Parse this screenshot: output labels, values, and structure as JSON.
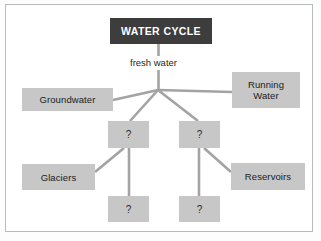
{
  "diagram": {
    "type": "concept-map",
    "title": "WATER CYCLE",
    "frame": {
      "border_color": "#b9bcbd",
      "background": "#ffffff"
    },
    "colors": {
      "title_box_fill": "#3d3d3d",
      "title_box_text": "#ffffff",
      "node_fill": "#c7c7c7",
      "node_text": "#1b1b1b",
      "connector": "#a3a3a3"
    },
    "nodes": [
      {
        "id": "title",
        "label": "WATER CYCLE",
        "kind": "title"
      },
      {
        "id": "fresh-water",
        "label": "fresh water",
        "kind": "plain-label"
      },
      {
        "id": "groundwater",
        "label": "Groundwater",
        "kind": "box"
      },
      {
        "id": "running-water",
        "label": "Running\nWater",
        "kind": "box"
      },
      {
        "id": "q-left",
        "label": "?",
        "kind": "question"
      },
      {
        "id": "q-right",
        "label": "?",
        "kind": "question"
      },
      {
        "id": "glaciers",
        "label": "Glaciers",
        "kind": "box"
      },
      {
        "id": "reservoirs",
        "label": "Reservoirs",
        "kind": "box"
      },
      {
        "id": "q-bottom-left",
        "label": "?",
        "kind": "question"
      },
      {
        "id": "q-bottom-right",
        "label": "?",
        "kind": "question"
      }
    ],
    "edges": [
      {
        "from": "title",
        "to": "hub"
      },
      {
        "from": "hub",
        "to": "groundwater"
      },
      {
        "from": "hub",
        "to": "running-water"
      },
      {
        "from": "hub",
        "to": "q-left"
      },
      {
        "from": "hub",
        "to": "q-right"
      },
      {
        "from": "q-left",
        "to": "glaciers"
      },
      {
        "from": "q-left",
        "to": "q-bottom-left"
      },
      {
        "from": "q-right",
        "to": "reservoirs"
      },
      {
        "from": "q-right",
        "to": "q-bottom-right"
      }
    ]
  }
}
